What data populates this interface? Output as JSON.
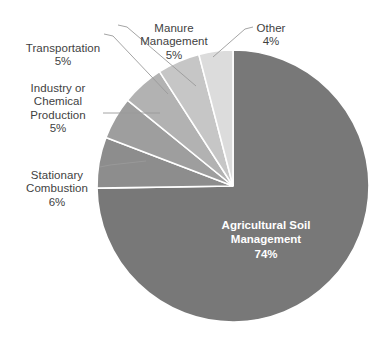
{
  "chart_data": {
    "type": "pie",
    "title": "",
    "subtitle": "",
    "xlabel": "",
    "ylabel": "",
    "legend_position": "none",
    "grid": false,
    "unit": "%",
    "start_angle_deg": 0,
    "direction": "clockwise",
    "categories": [
      "Agricultural Soil Management",
      "Stationary Combustion",
      "Industry or Chemical Production",
      "Transportation",
      "Manure Management",
      "Other"
    ],
    "values": [
      74,
      6,
      5,
      5,
      5,
      4
    ],
    "labels_displayed": [
      "74%",
      "6%",
      "5%",
      "5%",
      "5%",
      "4%"
    ],
    "colors": [
      "#787878",
      "#8d8d8d",
      "#9e9e9e",
      "#b2b2b2",
      "#c6c6c6",
      "#dcdcdc"
    ],
    "slice_border_color": "#ffffff"
  },
  "slices": {
    "agricultural_soil_management": {
      "name_line1": "Agricultural Soil",
      "name_line2": "Management",
      "percent": "74%",
      "color": "#787878"
    },
    "stationary_combustion": {
      "name_line1": "Stationary",
      "name_line2": "Combustion",
      "percent": "6%",
      "color": "#8d8d8d"
    },
    "industry_or_chemical_production": {
      "name_line1": "Industry or",
      "name_line2": "Chemical",
      "name_line3": "Production",
      "percent": "5%",
      "color": "#9e9e9e"
    },
    "transportation": {
      "name_line1": "Transportation",
      "percent": "5%",
      "color": "#b2b2b2"
    },
    "manure_management": {
      "name_line1": "Manure",
      "name_line2": "Management",
      "percent": "5%",
      "color": "#c6c6c6"
    },
    "other": {
      "name_line1": "Other",
      "percent": "4%",
      "color": "#dcdcdc"
    }
  },
  "labels": {
    "transportation_text": "Transportation",
    "transportation_pct": "5%",
    "industry_text": "Industry or\nChemical\nProduction",
    "industry_pct": "5%",
    "stationary_text": "Stationary\nCombustion",
    "stationary_pct": "6%",
    "manure_text": "Manure\nManagement",
    "manure_pct": "5%",
    "other_text": "Other",
    "other_pct": "4%",
    "asm_text": "Agricultural Soil\nManagement",
    "asm_pct": "74%"
  }
}
